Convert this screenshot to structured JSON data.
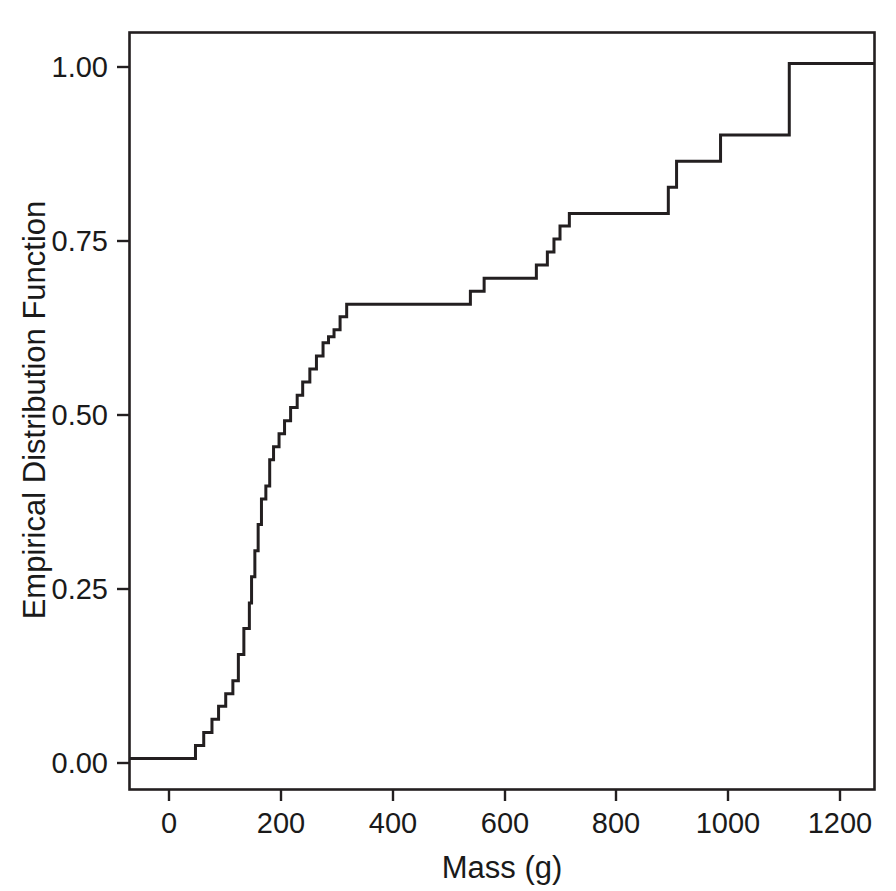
{
  "chart_data": {
    "type": "line",
    "subtype": "step-ecdf",
    "title": "",
    "xlabel": "Mass (g)",
    "ylabel": "Empirical Distribution Function",
    "xlim": [
      -100,
      1255
    ],
    "ylim": [
      -0.045,
      1.055
    ],
    "xticks": [
      0,
      200,
      400,
      600,
      800,
      1000,
      1200
    ],
    "xtick_labels": [
      "0",
      "200",
      "400",
      "600",
      "800",
      "1000",
      "1200"
    ],
    "yticks": [
      0.0,
      0.25,
      0.5,
      0.75,
      1.0
    ],
    "ytick_labels": [
      "0.00",
      "0.25",
      "0.50",
      "0.75",
      "1.00"
    ],
    "grid": false,
    "legend": null,
    "line_color": "#231f20",
    "background_color": "#ffffff",
    "box_frame": true,
    "n_observations": 53,
    "step_size": 0.0189,
    "x": [
      -100,
      5,
      20,
      35,
      50,
      62,
      75,
      88,
      98,
      108,
      118,
      122,
      128,
      134,
      140,
      148,
      155,
      162,
      172,
      182,
      193,
      205,
      215,
      228,
      240,
      252,
      262,
      272,
      283,
      295,
      310,
      505,
      520,
      545,
      620,
      640,
      660,
      672,
      683,
      700,
      810,
      880,
      895,
      975,
      1000,
      1100,
      1255
    ],
    "y": [
      0.0,
      0.0,
      0.019,
      0.038,
      0.057,
      0.076,
      0.094,
      0.113,
      0.151,
      0.189,
      0.226,
      0.264,
      0.302,
      0.34,
      0.377,
      0.396,
      0.434,
      0.453,
      0.472,
      0.491,
      0.51,
      0.528,
      0.547,
      0.566,
      0.585,
      0.604,
      0.613,
      0.623,
      0.642,
      0.66,
      0.66,
      0.66,
      0.679,
      0.698,
      0.698,
      0.717,
      0.736,
      0.755,
      0.774,
      0.792,
      0.792,
      0.83,
      0.868,
      0.906,
      0.906,
      1.01,
      1.01
    ]
  },
  "axes": {
    "x_axis_title": "Mass (g)",
    "y_axis_title": "Empirical Distribution Function",
    "x_tick_labels": [
      "0",
      "200",
      "400",
      "600",
      "800",
      "1000",
      "1200"
    ],
    "y_tick_labels": [
      "0.00",
      "0.25",
      "0.50",
      "0.75",
      "1.00"
    ]
  },
  "style": {
    "line_color": "#231f20",
    "frame_color": "#231f20",
    "text_color": "#1a1a1a",
    "background_color": "#ffffff"
  }
}
